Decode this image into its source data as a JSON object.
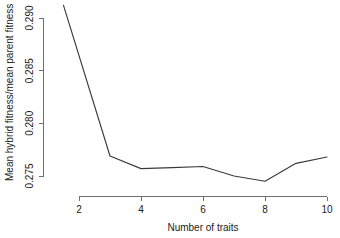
{
  "chart_data": {
    "type": "line",
    "title": "",
    "subtitle": "",
    "xlabel": "Number of traits",
    "ylabel": "Mean hybrid fitness/mean parent fitness",
    "x": [
      1.5,
      3,
      4,
      5,
      6,
      7,
      8,
      9,
      10
    ],
    "values": [
      0.2912,
      0.2769,
      0.2757,
      0.2758,
      0.2759,
      0.275,
      0.2745,
      0.2762,
      0.2768
    ],
    "series": [
      {
        "name": "mean hybrid fitness ratio",
        "values": [
          0.2912,
          0.2769,
          0.2757,
          0.2758,
          0.2759,
          0.275,
          0.2745,
          0.2762,
          0.2768
        ]
      }
    ],
    "xticks": [
      2,
      4,
      6,
      8,
      10
    ],
    "xtick_labels": [
      "2",
      "4",
      "6",
      "8",
      "10"
    ],
    "yticks": [
      0.275,
      0.28,
      0.285,
      0.29
    ],
    "ytick_labels": [
      "0.275",
      "0.280",
      "0.285",
      "0.290"
    ],
    "xlim": [
      1.5,
      10.2
    ],
    "ylim": [
      0.2742,
      0.2912
    ],
    "grid": false,
    "legend": false,
    "legend_position": "none",
    "line_color": "#3b3b3b",
    "axis_color": "#6f6f6f",
    "background_color": "#ffffff",
    "annotations": []
  },
  "axes": {
    "x_title": "Number of traits",
    "y_title": "Mean hybrid fitness/mean parent fitness"
  }
}
